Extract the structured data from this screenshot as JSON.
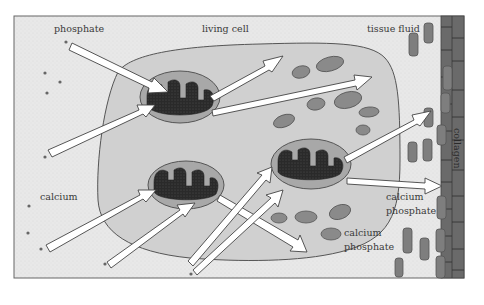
{
  "diagram": {
    "labels": {
      "phosphate": "phosphate",
      "living_cell": "living cell",
      "tissue_fluid": "tissue fluid",
      "calcium": "calcium",
      "collagen": "collagen",
      "calcium_phosphate_inner_1": "calcium",
      "calcium_phosphate_inner_2": "phosphate",
      "calcium_phosphate_outer_1": "calcium",
      "calcium_phosphate_outer_2": "phosphate"
    },
    "colors": {
      "background": "#e6e6e6",
      "cell": "#cfcfcf",
      "mitochondrion_outer": "#a8a8a8",
      "mitochondrion_cristae": "#2e2e2e",
      "granule": "#8a8a8a",
      "collagen": "#6a6a6a",
      "arrow_fill": "#ffffff",
      "outline": "#555555"
    },
    "components": [
      {
        "name": "phosphate ions",
        "region": "tissue fluid, upper-left"
      },
      {
        "name": "calcium ions",
        "region": "tissue fluid, lower-left"
      },
      {
        "name": "living cell",
        "region": "center"
      },
      {
        "name": "mitochondria",
        "count": 3
      },
      {
        "name": "calcium phosphate granules",
        "region": "cell cytoplasm and tissue fluid"
      },
      {
        "name": "collagen",
        "region": "right edge"
      }
    ]
  }
}
